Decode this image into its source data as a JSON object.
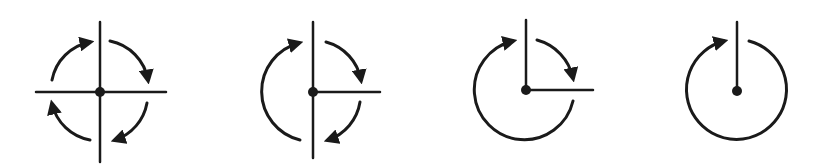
{
  "diagram": {
    "colors": {
      "ink": "#1a1a1a",
      "background": "#ffffff"
    },
    "figures": [
      {
        "name": "four-quadrant-rotation",
        "center": [
          100,
          92
        ],
        "rays": [
          [
            100,
            22
          ],
          [
            100,
            162
          ],
          [
            36,
            92
          ],
          [
            166,
            92
          ]
        ],
        "arcs": [
          {
            "from_deg": 200,
            "to_deg": 252,
            "arrow": "end"
          },
          {
            "from_deg": 293,
            "to_deg": 345,
            "arrow": "end"
          },
          {
            "from_deg": 20,
            "to_deg": 75,
            "arrow": "end"
          },
          {
            "from_deg": 110,
            "to_deg": 160,
            "arrow": "end"
          }
        ]
      },
      {
        "name": "three-ray-rotation",
        "center": [
          313,
          92
        ],
        "rays": [
          [
            313,
            22
          ],
          [
            313,
            158
          ],
          [
            380,
            92
          ]
        ],
        "arcs": [
          {
            "from_deg": 108,
            "to_deg": 250,
            "arrow": "end",
            "direction": "ccw-from-bottom"
          },
          {
            "from_deg": 293,
            "to_deg": 345,
            "arrow": "end"
          },
          {
            "from_deg": 20,
            "to_deg": 75,
            "arrow": "end"
          }
        ]
      },
      {
        "name": "two-ray-rotation",
        "center": [
          526,
          90
        ],
        "rays": [
          [
            526,
            20
          ],
          [
            593,
            90
          ]
        ],
        "arcs": [
          {
            "from_deg": 293,
            "to_deg": 345,
            "arrow": "end"
          },
          {
            "from_deg": 18,
            "to_deg": 255,
            "arrow": "end",
            "sweep": "long"
          }
        ]
      },
      {
        "name": "single-ray-rotation",
        "center": [
          737,
          91
        ],
        "rays": [
          [
            737,
            22
          ]
        ],
        "arcs": [
          {
            "from_deg": 290,
            "to_deg": 255,
            "arrow": "end",
            "sweep": "near-full"
          }
        ]
      }
    ]
  }
}
